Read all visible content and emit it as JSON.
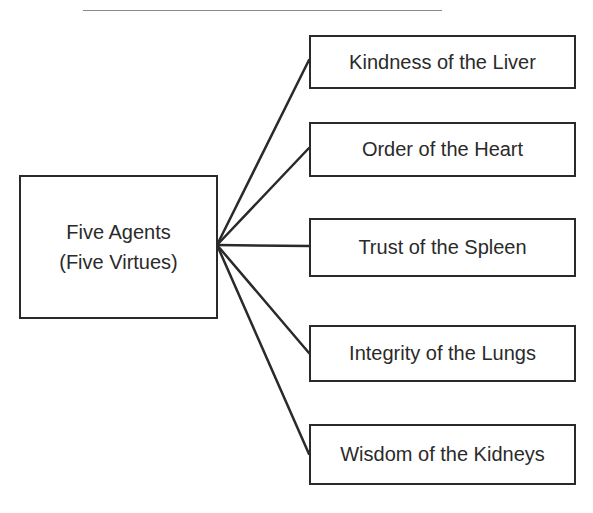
{
  "diagram": {
    "root": {
      "line1": "Five Agents",
      "line2": "(Five Virtues)"
    },
    "children": [
      {
        "label": "Kindness of the Liver"
      },
      {
        "label": "Order of the Heart"
      },
      {
        "label": "Trust of the Spleen"
      },
      {
        "label": "Integrity of the Lungs"
      },
      {
        "label": "Wisdom of the Kidneys"
      }
    ]
  },
  "colors": {
    "stroke": "#2a2a2a",
    "rule": "#8a8a8a",
    "background": "#ffffff"
  }
}
